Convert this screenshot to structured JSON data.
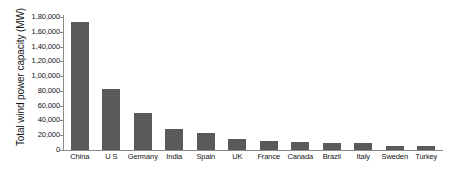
{
  "chart_data": {
    "type": "bar",
    "title": "",
    "xlabel": "",
    "ylabel": "Total wind power capacity (MW)",
    "ylim": [
      0,
      180000
    ],
    "ytick_step": 20000,
    "grid": false,
    "legend": null,
    "bar_color": "#5a5a5a",
    "axis_color": "#8a8a8a",
    "number_format": "indian",
    "categories": [
      "China",
      "U S",
      "Germany",
      "India",
      "Spain",
      "UK",
      "France",
      "Canada",
      "Brazil",
      "Italy",
      "Sweden",
      "Turkey"
    ],
    "values": [
      173000,
      82000,
      50000,
      29000,
      23000,
      15000,
      12000,
      11000,
      10000,
      9000,
      6000,
      6000
    ],
    "ytick_labels": [
      "1,80,000",
      "1,60,000",
      "1,40,000",
      "1,20,000",
      "1,00,000",
      "80,000",
      "60,000",
      "40,000",
      "20,000",
      "0"
    ],
    "ytick_values": [
      180000,
      160000,
      140000,
      120000,
      100000,
      80000,
      60000,
      40000,
      20000,
      0
    ]
  }
}
